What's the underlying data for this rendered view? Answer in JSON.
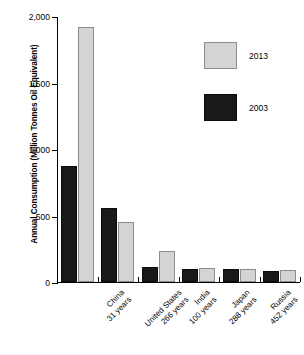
{
  "chart_data": {
    "type": "bar",
    "title": "",
    "subtitle": "",
    "xlabel": "",
    "ylabel": "Annual Consumption (Million Tonnes Oil Equivalent)",
    "ylim": [
      0,
      2000
    ],
    "yticks": [
      0,
      500,
      1000,
      1500,
      2000
    ],
    "ytick_labels": [
      "0",
      "500",
      "1,000",
      "1,500",
      "2,000"
    ],
    "grid": false,
    "legend_position": "top-right",
    "categories": [
      "China",
      "United States",
      "India",
      "Japan",
      "Russia",
      "South Africa"
    ],
    "category_sublabels": [
      "31 years",
      "266 years",
      "100 years",
      "288 years",
      "452 years",
      "117 years"
    ],
    "series": [
      {
        "name": "2003",
        "color": "#191919",
        "values": [
          875,
          560,
          110,
          100,
          95,
          80
        ]
      },
      {
        "name": "2013",
        "color": "#d4d4d4",
        "values": [
          1920,
          455,
          235,
          105,
          100,
          90
        ]
      }
    ]
  },
  "legend": {
    "entries": [
      {
        "label": "2013",
        "swatch": "light-gray"
      },
      {
        "label": "2003",
        "swatch": "black"
      }
    ]
  },
  "axis": {
    "y_title": "Annual Consumption (Million Tonnes Oil Equivalent)"
  }
}
